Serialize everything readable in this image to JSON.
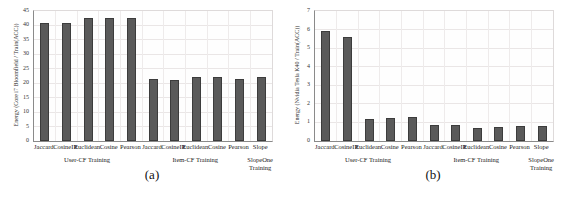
{
  "figure": {
    "colors": {
      "bar_fill": "#5a5a5a",
      "bar_border": "#3c3c3c",
      "grid": "#eae6e6",
      "axis": "#8a8a8a",
      "background": "#ffffff"
    }
  },
  "chart_data": [
    {
      "id": "a",
      "type": "bar",
      "caption": "(a)",
      "title": "",
      "xlabel": "",
      "ylabel": "Energy (Core i7 Bloomfield / Train(ACC))",
      "ylim": [
        0,
        45
      ],
      "yticks": [
        0,
        5,
        10,
        15,
        20,
        25,
        30,
        35,
        40,
        45
      ],
      "grid": true,
      "legend": null,
      "categories": [
        "Jaccard",
        "CosineIR",
        "Euclidean",
        "Cosine",
        "Pearson",
        "Jaccard",
        "CosineIR",
        "Euclidean",
        "Cosine",
        "Pearson",
        "Slope"
      ],
      "values": [
        41,
        41,
        42.5,
        42.5,
        42.5,
        21.5,
        21,
        22,
        22,
        21.5,
        22
      ],
      "groups": [
        {
          "lines": [
            "User-CF Training"
          ],
          "from": 0,
          "to": 4
        },
        {
          "lines": [
            "Item-CF Training"
          ],
          "from": 5,
          "to": 9
        },
        {
          "lines": [
            "SlopeOne",
            "Training"
          ],
          "from": 10,
          "to": 10
        }
      ]
    },
    {
      "id": "b",
      "type": "bar",
      "caption": "(b)",
      "title": "",
      "xlabel": "",
      "ylabel": "Energy (Nvidia Tesla K40 / Train(ACC))",
      "ylim": [
        0,
        7
      ],
      "yticks": [
        0,
        1,
        2,
        3,
        4,
        5,
        6,
        7
      ],
      "grid": true,
      "legend": null,
      "categories": [
        "Jaccard",
        "CosineIR",
        "Euclidean",
        "Cosine",
        "Pearson",
        "Jaccard",
        "CosineIR",
        "Euclidean",
        "Cosine",
        "Pearson",
        "Slope"
      ],
      "values": [
        5.9,
        5.6,
        1.2,
        1.25,
        1.3,
        0.85,
        0.85,
        0.7,
        0.75,
        0.8,
        0.8
      ],
      "groups": [
        {
          "lines": [
            "User-CF Training"
          ],
          "from": 0,
          "to": 4
        },
        {
          "lines": [
            "Item-CF Training"
          ],
          "from": 5,
          "to": 9
        },
        {
          "lines": [
            "SlopeOne",
            "Training"
          ],
          "from": 10,
          "to": 10
        }
      ]
    }
  ]
}
